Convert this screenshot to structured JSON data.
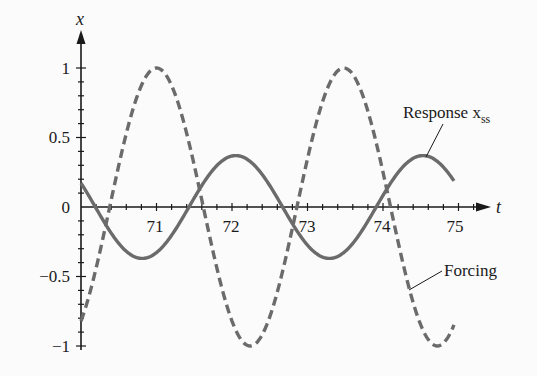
{
  "chart_data": {
    "type": "line",
    "title": "",
    "xlabel": "t",
    "ylabel": "x",
    "xlim": [
      70,
      75.4
    ],
    "ylim": [
      -1,
      1
    ],
    "x_ticks": [
      71,
      72,
      73,
      74,
      75
    ],
    "x_tick_labels": [
      "71",
      "72",
      "73",
      "74",
      "75"
    ],
    "y_ticks": [
      1,
      0.5,
      0,
      -0.5,
      -1
    ],
    "y_tick_labels": [
      "1",
      "0.5",
      "0",
      "−0.5",
      "−1"
    ],
    "minor_tick_step_x": 0.2,
    "minor_tick_step_y": 0.1,
    "grid": false,
    "legend": "none (inline annotations)",
    "series": [
      {
        "name": "Response x_ss",
        "style": "solid",
        "color": "#6b6b6b",
        "amplitude": 0.37,
        "period": 2.48,
        "x_range": [
          70,
          74.95
        ],
        "points": [
          [
            70.0,
            0.17
          ],
          [
            70.8,
            -0.37
          ],
          [
            71.43,
            0.0
          ],
          [
            72.05,
            0.37
          ],
          [
            72.67,
            0.0
          ],
          [
            73.3,
            -0.37
          ],
          [
            73.92,
            0.0
          ],
          [
            74.5,
            0.36
          ],
          [
            74.95,
            0.17
          ]
        ]
      },
      {
        "name": "Forcing",
        "style": "dashed",
        "color": "#6b6b6b",
        "amplitude": 1.0,
        "period": 2.48,
        "x_range": [
          70,
          74.95
        ],
        "points": [
          [
            70.0,
            -0.8
          ],
          [
            70.38,
            0.0
          ],
          [
            71.0,
            1.0
          ],
          [
            71.62,
            0.0
          ],
          [
            72.24,
            -1.0
          ],
          [
            72.86,
            0.0
          ],
          [
            73.48,
            1.0
          ],
          [
            74.1,
            0.0
          ],
          [
            74.72,
            -1.0
          ],
          [
            74.95,
            -0.87
          ]
        ]
      }
    ],
    "annotations": [
      {
        "text": "Response x",
        "subscript": "ss",
        "points_to": "Response x_ss"
      },
      {
        "text": "Forcing",
        "points_to": "Forcing"
      }
    ]
  },
  "labels": {
    "y_axis_var": "x",
    "x_axis_var": "t",
    "x_ticks": [
      "71",
      "72",
      "73",
      "74",
      "75"
    ],
    "y_ticks": [
      "1",
      "0.5",
      "0",
      "−0.5",
      "−1"
    ],
    "response_label": "Response x",
    "response_sub": "ss",
    "forcing_label": "Forcing"
  },
  "colors": {
    "curve": "#6b6b6b",
    "axis": "#1a1a1a",
    "background": "#fbfbfb"
  }
}
